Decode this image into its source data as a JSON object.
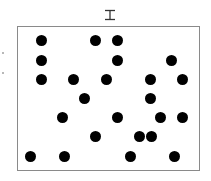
{
  "title": {
    "icon": "i-beam-glyph"
  },
  "board": {
    "frame_color": "#8a8a8a",
    "dot_color": "#000000",
    "dot_diameter": 11,
    "dots": [
      {
        "x": 41,
        "y": 40
      },
      {
        "x": 95,
        "y": 40
      },
      {
        "x": 117,
        "y": 40
      },
      {
        "x": 41,
        "y": 60
      },
      {
        "x": 117,
        "y": 60
      },
      {
        "x": 171,
        "y": 60
      },
      {
        "x": 41,
        "y": 79
      },
      {
        "x": 73,
        "y": 79
      },
      {
        "x": 106,
        "y": 79
      },
      {
        "x": 150,
        "y": 79
      },
      {
        "x": 182,
        "y": 79
      },
      {
        "x": 84,
        "y": 98
      },
      {
        "x": 150,
        "y": 98
      },
      {
        "x": 62,
        "y": 117
      },
      {
        "x": 117,
        "y": 117
      },
      {
        "x": 160,
        "y": 117
      },
      {
        "x": 182,
        "y": 117
      },
      {
        "x": 95,
        "y": 136
      },
      {
        "x": 139,
        "y": 136
      },
      {
        "x": 151,
        "y": 136
      },
      {
        "x": 30,
        "y": 156
      },
      {
        "x": 64,
        "y": 156
      },
      {
        "x": 130,
        "y": 156
      },
      {
        "x": 174,
        "y": 156
      }
    ]
  },
  "side_marks": [
    {
      "x": 2,
      "y": 52
    },
    {
      "x": 2,
      "y": 72
    }
  ]
}
